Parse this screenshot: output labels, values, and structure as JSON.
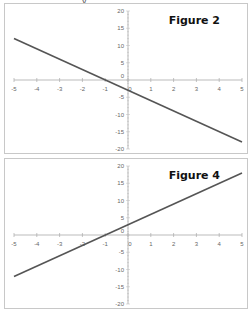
{
  "page": {
    "top_fragment": "y"
  },
  "chart_data": [
    {
      "type": "line",
      "title": "Figure 2",
      "xlabel": "",
      "ylabel": "",
      "x_ticks": [
        -5,
        -4,
        -3,
        -2,
        -1,
        0,
        1,
        2,
        3,
        4,
        5
      ],
      "y_ticks": [
        20,
        15,
        10,
        5,
        0,
        -5,
        -10,
        -15,
        -20
      ],
      "xlim": [
        -5,
        5
      ],
      "ylim": [
        -20,
        20
      ],
      "grid": false,
      "series": [
        {
          "name": "y = -3x - 3",
          "x": [
            -5,
            5
          ],
          "y": [
            12,
            -18
          ]
        }
      ],
      "line_color": "#555555"
    },
    {
      "type": "line",
      "title": "Figure 4",
      "xlabel": "",
      "ylabel": "",
      "x_ticks": [
        -5,
        -4,
        -3,
        -2,
        -1,
        0,
        1,
        2,
        3,
        4,
        5
      ],
      "y_ticks": [
        20,
        15,
        10,
        5,
        0,
        -5,
        -10,
        -15,
        -20
      ],
      "xlim": [
        -5,
        5
      ],
      "ylim": [
        -20,
        20
      ],
      "grid": false,
      "series": [
        {
          "name": "y = 3x + 3",
          "x": [
            -5,
            5
          ],
          "y": [
            -12,
            18
          ]
        }
      ],
      "line_color": "#555555"
    }
  ]
}
